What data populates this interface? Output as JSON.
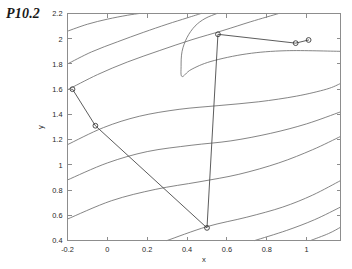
{
  "figure": {
    "title": "P10.2",
    "background_color": "#ffffff",
    "contour_color": "#6f6f6f",
    "path_color": "#4a4a4a"
  },
  "chart_data": {
    "type": "line",
    "plot_kind": "contour-with-optimization-path",
    "title": "P10.2",
    "xlabel": "x",
    "ylabel": "y",
    "xlim": [
      -0.2,
      1.17
    ],
    "ylim": [
      0.4,
      2.2
    ],
    "grid": false,
    "legend": "none",
    "xticks": [
      -0.2,
      0,
      0.2,
      0.4,
      0.6,
      0.8,
      1
    ],
    "xticklabels": [
      "-0.2",
      "0",
      "0.2",
      "0.4",
      "0.6",
      "0.8",
      "1"
    ],
    "yticks": [
      0.4,
      0.6,
      0.8,
      1,
      1.2,
      1.4,
      1.6,
      1.8,
      2,
      2.2
    ],
    "yticklabels": [
      "0.4",
      "0.6",
      "0.8",
      "1",
      "1.2",
      "1.4",
      "1.6",
      "1.8",
      "2",
      "2.2"
    ],
    "series": [
      {
        "name": "iteration-path",
        "marker": "circle-open",
        "x": [
          -0.175,
          -0.06,
          0.5,
          0.555,
          0.945,
          1.01
        ],
        "y": [
          1.6,
          1.31,
          0.5,
          2.035,
          1.965,
          1.99
        ]
      }
    ],
    "contours": [
      {
        "name": "contour-1",
        "points": [
          [
            -0.2,
            2.06
          ],
          [
            -0.1,
            2.115
          ],
          [
            0.0,
            2.155
          ],
          [
            0.1,
            2.186
          ],
          [
            0.16,
            2.2
          ]
        ]
      },
      {
        "name": "contour-2",
        "points": [
          [
            -0.2,
            1.8
          ],
          [
            -0.08,
            1.895
          ],
          [
            0.05,
            1.975
          ],
          [
            0.18,
            2.05
          ],
          [
            0.3,
            2.115
          ],
          [
            0.4,
            2.165
          ],
          [
            0.47,
            2.2
          ]
        ]
      },
      {
        "name": "contour-3",
        "points": [
          [
            -0.2,
            1.595
          ],
          [
            -0.05,
            1.715
          ],
          [
            0.1,
            1.815
          ],
          [
            0.26,
            1.905
          ],
          [
            0.42,
            1.99
          ],
          [
            0.58,
            2.065
          ],
          [
            0.72,
            2.135
          ],
          [
            0.86,
            2.2
          ]
        ]
      },
      {
        "name": "contour-4-valley",
        "points": [
          [
            1.17,
            1.9
          ],
          [
            0.9,
            1.905
          ],
          [
            0.7,
            1.88
          ],
          [
            0.52,
            1.82
          ],
          [
            0.42,
            1.755
          ],
          [
            0.375,
            1.7
          ],
          [
            0.37,
            1.78
          ],
          [
            0.375,
            1.9
          ],
          [
            0.4,
            2.01
          ],
          [
            0.44,
            2.1
          ],
          [
            0.49,
            2.16
          ],
          [
            0.55,
            2.2
          ]
        ]
      },
      {
        "name": "contour-5",
        "points": [
          [
            -0.2,
            1.16
          ],
          [
            -0.02,
            1.295
          ],
          [
            0.16,
            1.385
          ],
          [
            0.36,
            1.44
          ],
          [
            0.56,
            1.47
          ],
          [
            0.76,
            1.5
          ],
          [
            0.95,
            1.545
          ],
          [
            1.1,
            1.6
          ],
          [
            1.17,
            1.645
          ]
        ]
      },
      {
        "name": "contour-6",
        "points": [
          [
            -0.2,
            0.88
          ],
          [
            0.0,
            1.015
          ],
          [
            0.2,
            1.105
          ],
          [
            0.42,
            1.155
          ],
          [
            0.62,
            1.19
          ],
          [
            0.82,
            1.25
          ],
          [
            1.0,
            1.325
          ],
          [
            1.17,
            1.42
          ]
        ]
      },
      {
        "name": "contour-7",
        "points": [
          [
            -0.2,
            0.57
          ],
          [
            0.02,
            0.715
          ],
          [
            0.24,
            0.805
          ],
          [
            0.46,
            0.865
          ],
          [
            0.66,
            0.925
          ],
          [
            0.86,
            1.015
          ],
          [
            1.03,
            1.12
          ],
          [
            1.17,
            1.225
          ]
        ]
      },
      {
        "name": "contour-8",
        "points": [
          [
            0.3,
            0.4
          ],
          [
            0.5,
            0.51
          ],
          [
            0.7,
            0.585
          ],
          [
            0.88,
            0.665
          ],
          [
            1.03,
            0.76
          ],
          [
            1.17,
            0.875
          ]
        ]
      },
      {
        "name": "contour-9",
        "points": [
          [
            0.74,
            0.4
          ],
          [
            0.9,
            0.48
          ],
          [
            1.04,
            0.565
          ],
          [
            1.17,
            0.665
          ]
        ]
      },
      {
        "name": "contour-10",
        "points": [
          [
            1.02,
            0.4
          ],
          [
            1.11,
            0.455
          ],
          [
            1.17,
            0.505
          ]
        ]
      }
    ]
  },
  "axes": {
    "xlabel": "x",
    "ylabel": "y"
  }
}
